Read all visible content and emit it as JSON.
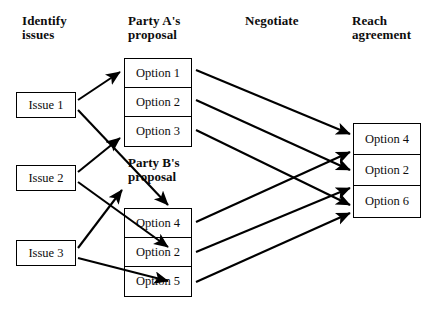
{
  "diagram": {
    "title_columns": [
      {
        "id": "identify",
        "label": "Identify\nissues"
      },
      {
        "id": "party-a",
        "label": "Party A's\nproposal"
      },
      {
        "id": "negotiate",
        "label": "Negotiate"
      },
      {
        "id": "reach",
        "label": "Reach\nagreement"
      }
    ],
    "party_b_heading": "Party B's\nproposal",
    "issues": [
      {
        "id": "issue-1",
        "label": "Issue 1"
      },
      {
        "id": "issue-2",
        "label": "Issue 2"
      },
      {
        "id": "issue-3",
        "label": "Issue 3"
      }
    ],
    "party_a_options": [
      {
        "id": "a-opt-1",
        "label": "Option 1"
      },
      {
        "id": "a-opt-2",
        "label": "Option 2"
      },
      {
        "id": "a-opt-3",
        "label": "Option 3"
      }
    ],
    "party_b_options": [
      {
        "id": "b-opt-1",
        "label": "Option 4"
      },
      {
        "id": "b-opt-2",
        "label": "Option 2"
      },
      {
        "id": "b-opt-3",
        "label": "Option 5"
      }
    ],
    "agreement_options": [
      {
        "id": "agree-opt-1",
        "label": "Option 4"
      },
      {
        "id": "agree-opt-2",
        "label": "Option 2"
      },
      {
        "id": "agree-opt-3",
        "label": "Option 6"
      }
    ],
    "colors": {
      "background": "#ffffff",
      "stroke": "#000000",
      "text": "#0d0d0d"
    },
    "connections": [
      {
        "from": "issue-1",
        "to": "a-opt-1"
      },
      {
        "from": "issue-1",
        "to": "b-opt-1"
      },
      {
        "from": "issue-2",
        "to": "a-opt-3"
      },
      {
        "from": "issue-2",
        "to": "b-opt-2"
      },
      {
        "from": "issue-3",
        "to": "a-opt-3"
      },
      {
        "from": "issue-3",
        "to": "b-opt-3"
      },
      {
        "from": "a-opt-1",
        "to": "agree-opt-1"
      },
      {
        "from": "a-opt-2",
        "to": "agree-opt-2"
      },
      {
        "from": "a-opt-3",
        "to": "agree-opt-3"
      },
      {
        "from": "b-opt-1",
        "to": "agree-opt-1"
      },
      {
        "from": "b-opt-2",
        "to": "agree-opt-2"
      },
      {
        "from": "b-opt-3",
        "to": "agree-opt-3"
      }
    ]
  }
}
